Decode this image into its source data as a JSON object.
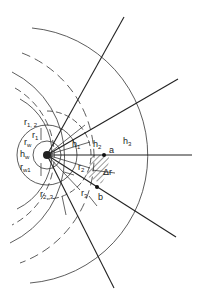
{
  "diagram": {
    "type": "radial flow net around well",
    "center": [
      47,
      155
    ],
    "labels": {
      "r12": "r",
      "r12_sub": "1, 2",
      "r1": "r",
      "r1_sub": "1",
      "rw": "r",
      "rw_sub": "w",
      "hw": "h",
      "hw_sub": "w",
      "rw1": "r",
      "rw1_sub": "w1",
      "h1": "h",
      "h1_sub": "1",
      "h2": "h",
      "h2_sub": "2",
      "h3": "h",
      "h3_sub": "3",
      "a": "a",
      "b": "b",
      "delta_r": "Δr",
      "r2": "r",
      "r2_sub": "2",
      "r23": "r",
      "r23_sub": "2, 3",
      "r3": "r",
      "r3_sub": "3"
    },
    "solid_arc_radii": [
      14,
      30,
      62,
      122
    ],
    "dashed_arc_radii": [
      22,
      44,
      92
    ],
    "ray_angles_deg": [
      -62,
      -30,
      0,
      28,
      62
    ],
    "colors": {
      "line": "#222222",
      "hatch": "#333333"
    }
  }
}
